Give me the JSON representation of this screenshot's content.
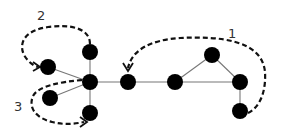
{
  "diagram": {
    "type": "graph-with-traversal-paths",
    "nodes": [
      {
        "id": "hub",
        "x": 90,
        "y": 82
      },
      {
        "id": "top",
        "x": 90,
        "y": 52
      },
      {
        "id": "left-upper",
        "x": 48,
        "y": 67
      },
      {
        "id": "left-lower",
        "x": 50,
        "y": 98
      },
      {
        "id": "bottom",
        "x": 90,
        "y": 113
      },
      {
        "id": "middle",
        "x": 128,
        "y": 82
      },
      {
        "id": "right-a",
        "x": 175,
        "y": 82
      },
      {
        "id": "top-right",
        "x": 212,
        "y": 55
      },
      {
        "id": "right-b",
        "x": 240,
        "y": 82
      },
      {
        "id": "bottom-right",
        "x": 240,
        "y": 111
      }
    ],
    "edges": [
      [
        "hub",
        "top"
      ],
      [
        "hub",
        "left-upper"
      ],
      [
        "hub",
        "left-lower"
      ],
      [
        "hub",
        "bottom"
      ],
      [
        "hub",
        "middle"
      ],
      [
        "middle",
        "right-a"
      ],
      [
        "right-a",
        "top-right"
      ],
      [
        "right-a",
        "right-b"
      ],
      [
        "top-right",
        "right-b"
      ],
      [
        "right-b",
        "bottom-right"
      ]
    ],
    "paths": [
      {
        "label": "1",
        "from": "bottom-right",
        "to": "middle"
      },
      {
        "label": "2",
        "from": "top",
        "to": "left-upper"
      },
      {
        "label": "3",
        "from": "hub",
        "to": "bottom"
      }
    ],
    "colors": {
      "node": "#000000",
      "edge": "#777777",
      "path": "#111111",
      "label": "#333333"
    }
  }
}
